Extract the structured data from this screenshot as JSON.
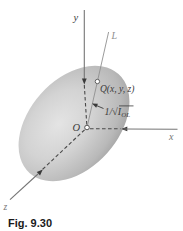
{
  "figure": {
    "caption": "Fig. 9.30",
    "labels": {
      "y_axis": "y",
      "x_axis": "x",
      "z_axis": "z",
      "line": "L",
      "origin": "O",
      "point": "Q(x, y, z)",
      "distance_prefix": "1/",
      "distance_radical": "√",
      "distance_symbol": "I",
      "distance_subscript": "OL"
    },
    "colors": {
      "background": "#ffffff",
      "ellipsoid_highlight": "#e4e4e4",
      "ellipsoid_mid": "#d3d3d3",
      "ellipsoid_shadow": "#b9b9b9",
      "ellipsoid_edge": "#949494",
      "axis_line": "#757575",
      "hidden_line": "#4a4a4a",
      "line_l": "#909090",
      "arrow": "#3a3a3a",
      "label_text": "#3b3b3b",
      "label_muted": "#8f8f8f",
      "caption_text": "#1a1a1a"
    }
  }
}
